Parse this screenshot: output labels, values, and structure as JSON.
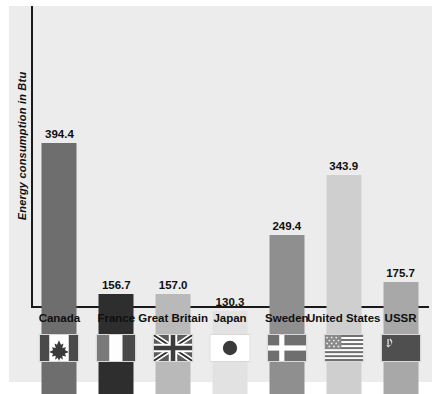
{
  "chart_data": {
    "type": "bar",
    "title": "",
    "xlabel": "",
    "ylabel": "Energy consumption in Btu",
    "ylim": [
      0,
      430
    ],
    "grid": false,
    "legend": "none",
    "categories": [
      "Canada",
      "France",
      "Great Britain",
      "Japan",
      "Sweden",
      "United States",
      "USSR"
    ],
    "values": [
      394.4,
      156.7,
      157.0,
      130.3,
      249.4,
      343.9,
      175.7
    ],
    "value_labels": [
      "394.4",
      "156.7",
      "157.0",
      "130.3",
      "249.4",
      "343.9",
      "175.7"
    ],
    "bar_colors": [
      "#6e6e6e",
      "#2e2e2e",
      "#b9b9b9",
      "#e2e2e2",
      "#8f8f8f",
      "#cfcfcf",
      "#a8a8a8"
    ],
    "flags": [
      "canada-flag-icon",
      "france-flag-icon",
      "great-britain-flag-icon",
      "japan-flag-icon",
      "sweden-flag-icon",
      "united-states-flag-icon",
      "ussr-flag-icon"
    ]
  },
  "style": {
    "panel_background": "#ececec",
    "page_background": "#ffffff",
    "axis_color": "#1a1a1a",
    "text_color": "#0f0f0f"
  }
}
